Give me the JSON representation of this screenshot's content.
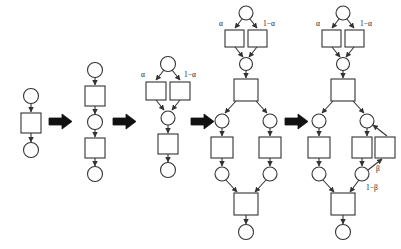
{
  "figure": {
    "type": "petri-net-refinement-sequence",
    "background_color": "#ffffff",
    "node_stroke_color": "#333333",
    "arrow_color": "#333333",
    "big_arrow_color": "#111111",
    "label_color": "#1a1a1a",
    "stage_count": 5,
    "separator_count": 4
  },
  "labels": {
    "alpha": "α",
    "one_minus_alpha": "1−α",
    "beta": "β",
    "one_minus_beta": "1−β"
  },
  "stages": [
    {
      "id": "stage-1",
      "name": "initial-net",
      "places": 2,
      "transitions": 1,
      "annotations": [],
      "description": "place, transition, place in sequence"
    },
    {
      "id": "stage-2",
      "name": "sequence-refinement",
      "places": 3,
      "transitions": 2,
      "annotations": [],
      "description": "transition refined into two transitions in sequence"
    },
    {
      "id": "stage-3",
      "name": "choice-refinement",
      "places": 3,
      "transitions": 3,
      "annotations": [
        "α",
        "1−α"
      ],
      "description": "first transition refined into probabilistic choice with weights alpha and 1 minus alpha"
    },
    {
      "id": "stage-4",
      "name": "parallel-refinement",
      "places": 7,
      "transitions": 6,
      "annotations": [
        "α",
        "1−α"
      ],
      "description": "second transition refined into fork and join with two parallel branches"
    },
    {
      "id": "stage-5",
      "name": "loop-refinement",
      "places": 7,
      "transitions": 7,
      "annotations": [
        "α",
        "1−α",
        "β",
        "1−β"
      ],
      "description": "right parallel branch augmented with a feedback loop weighted beta and exit weighted 1 minus beta"
    }
  ],
  "separators": [
    {
      "id": "separator-1",
      "name": "refinement-arrow"
    },
    {
      "id": "separator-2",
      "name": "refinement-arrow"
    },
    {
      "id": "separator-3",
      "name": "refinement-arrow"
    },
    {
      "id": "separator-4",
      "name": "refinement-arrow"
    }
  ]
}
